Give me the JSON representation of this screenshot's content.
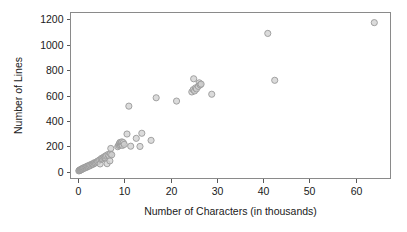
{
  "chart_data": {
    "type": "scatter",
    "title": "",
    "xlabel": "Number of Characters (in thousands)",
    "ylabel": "Number of Lines",
    "xlim": [
      -1.6,
      67.5
    ],
    "ylim": [
      -55,
      1255
    ],
    "xticks": [
      0,
      10,
      20,
      30,
      40,
      50,
      60
    ],
    "xtick_labels": [
      "0",
      "10",
      "20",
      "30",
      "40",
      "50",
      "60"
    ],
    "yticks": [
      0,
      200,
      400,
      600,
      800,
      1000,
      1200
    ],
    "ytick_labels": [
      "0",
      "200",
      "400",
      "600",
      "800",
      "1000",
      "1200"
    ],
    "grid": false,
    "legend": null,
    "marker": {
      "shape": "circle",
      "radius": 3.1,
      "fill": "#cfcfcf",
      "edge": "#9a9a9a",
      "opacity": 0.75
    },
    "colors": {
      "background": "#ffffff",
      "frame": "#8a8a8a",
      "text": "#1a1a1a",
      "tick": "#5a5a5a"
    },
    "points": [
      [
        0.2,
        5
      ],
      [
        0.3,
        10
      ],
      [
        0.4,
        8
      ],
      [
        0.5,
        14
      ],
      [
        0.6,
        12
      ],
      [
        0.7,
        18
      ],
      [
        0.8,
        16
      ],
      [
        0.9,
        22
      ],
      [
        1.0,
        20
      ],
      [
        1.1,
        26
      ],
      [
        1.2,
        24
      ],
      [
        1.3,
        30
      ],
      [
        1.5,
        28
      ],
      [
        1.6,
        34
      ],
      [
        1.8,
        32
      ],
      [
        1.9,
        38
      ],
      [
        2.0,
        42
      ],
      [
        2.2,
        40
      ],
      [
        2.3,
        46
      ],
      [
        2.5,
        44
      ],
      [
        2.6,
        52
      ],
      [
        2.8,
        50
      ],
      [
        3.0,
        56
      ],
      [
        3.1,
        60
      ],
      [
        3.3,
        58
      ],
      [
        3.5,
        64
      ],
      [
        3.6,
        70
      ],
      [
        3.8,
        68
      ],
      [
        4.0,
        74
      ],
      [
        4.2,
        80
      ],
      [
        4.3,
        78
      ],
      [
        4.5,
        86
      ],
      [
        4.7,
        92
      ],
      [
        4.8,
        60
      ],
      [
        5.0,
        96
      ],
      [
        5.1,
        104
      ],
      [
        5.3,
        100
      ],
      [
        5.5,
        110
      ],
      [
        5.7,
        116
      ],
      [
        5.9,
        108
      ],
      [
        6.0,
        122
      ],
      [
        6.2,
        128
      ],
      [
        6.3,
        62
      ],
      [
        6.5,
        134
      ],
      [
        6.7,
        126
      ],
      [
        6.9,
        84
      ],
      [
        7.0,
        140
      ],
      [
        7.1,
        182
      ],
      [
        7.3,
        132
      ],
      [
        8.6,
        196
      ],
      [
        8.8,
        206
      ],
      [
        8.9,
        214
      ],
      [
        9.0,
        222
      ],
      [
        9.1,
        230
      ],
      [
        9.2,
        210
      ],
      [
        9.3,
        226
      ],
      [
        9.4,
        218
      ],
      [
        9.5,
        234
      ],
      [
        9.6,
        206
      ],
      [
        9.8,
        228
      ],
      [
        10.0,
        214
      ],
      [
        10.6,
        296
      ],
      [
        11.0,
        516
      ],
      [
        11.4,
        200
      ],
      [
        12.6,
        262
      ],
      [
        13.4,
        198
      ],
      [
        13.8,
        302
      ],
      [
        15.8,
        246
      ],
      [
        16.9,
        582
      ],
      [
        21.3,
        556
      ],
      [
        24.6,
        628
      ],
      [
        24.9,
        646
      ],
      [
        25.0,
        732
      ],
      [
        25.2,
        636
      ],
      [
        25.4,
        660
      ],
      [
        25.6,
        652
      ],
      [
        26.0,
        672
      ],
      [
        26.2,
        700
      ],
      [
        26.4,
        684
      ],
      [
        26.6,
        690
      ],
      [
        28.9,
        610
      ],
      [
        41.0,
        1090
      ],
      [
        42.5,
        720
      ],
      [
        64.0,
        1175
      ]
    ]
  },
  "axis_labels": {
    "x_title": "Number of Characters (in thousands)",
    "y_title": "Number of Lines"
  }
}
